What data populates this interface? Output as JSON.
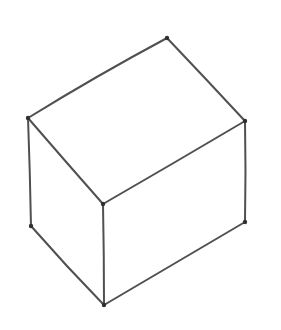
{
  "figure": {
    "background": "#ffffff",
    "stroke_color": "#505050",
    "stroke_width": 2,
    "vertex_color": "#303030",
    "vertices": [
      {
        "id": "top",
        "x": 167,
        "y": 38
      },
      {
        "id": "left",
        "x": 28,
        "y": 118
      },
      {
        "id": "right",
        "x": 245,
        "y": 121
      },
      {
        "id": "front",
        "x": 103,
        "y": 204
      },
      {
        "id": "bottom",
        "x": 104,
        "y": 305
      },
      {
        "id": "bottom_left",
        "x": 31,
        "y": 226
      },
      {
        "id": "bottom_right",
        "x": 245,
        "y": 222
      }
    ],
    "edges": [
      {
        "from": "top",
        "to": "left",
        "cx": 96,
        "cy": 76
      },
      {
        "from": "top",
        "to": "right",
        "cx": 207,
        "cy": 80
      },
      {
        "from": "left",
        "to": "front",
        "cx": 66,
        "cy": 162
      },
      {
        "from": "right",
        "to": "front",
        "cx": 174,
        "cy": 163
      },
      {
        "from": "left",
        "to": "bottom_left",
        "cx": 30,
        "cy": 172
      },
      {
        "from": "front",
        "to": "bottom",
        "cx": 104,
        "cy": 255
      },
      {
        "from": "right",
        "to": "bottom_right",
        "cx": 246,
        "cy": 171
      },
      {
        "from": "bottom_left",
        "to": "bottom",
        "cx": 66,
        "cy": 266
      },
      {
        "from": "bottom",
        "to": "bottom_right",
        "cx": 175,
        "cy": 263
      }
    ]
  }
}
